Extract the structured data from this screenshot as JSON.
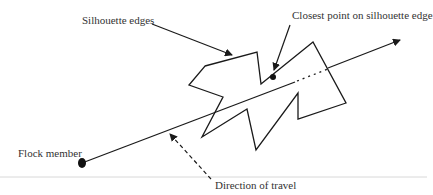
{
  "diagram": {
    "labels": {
      "silhouette_edges": "Silhouette edges",
      "closest_point": "Closest point on silhouette edge",
      "flock_member": "Flock member",
      "direction_of_travel": "Direction of travel"
    },
    "colors": {
      "stroke": "#1a1a1a",
      "text": "#333333",
      "divider": "#d8d8d8"
    }
  }
}
